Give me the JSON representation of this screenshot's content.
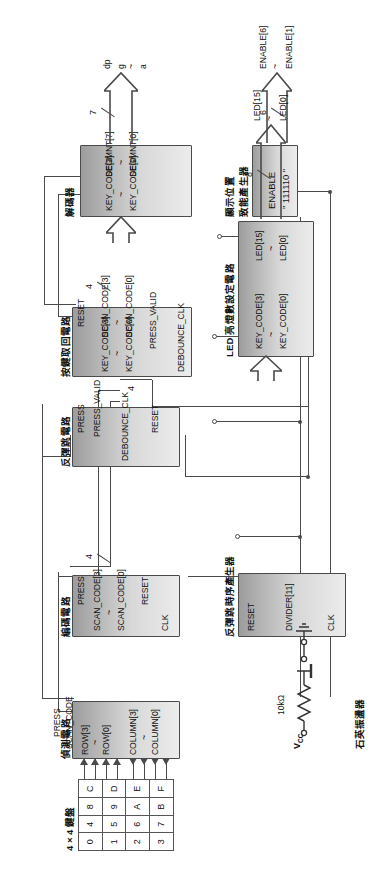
{
  "diagram": {
    "blocks": {
      "decoder": {
        "label": "解碼器",
        "in_top": "KEY_CODE[3]",
        "in_bot": "KEY_CODE[0]",
        "out_top": "SEGMNT[7]",
        "out_bot": "SEGMNT[0]",
        "bus_width": "7",
        "out_sig_top": "dp",
        "out_sig_mid": "g",
        "out_sig_bot": "a"
      },
      "enable_gen": {
        "label_line1": "顯示位置",
        "label_line2": "致能產生器",
        "body_line1": "ENABLE",
        "body_line2": "\" 111110 \"",
        "bus_width": "6",
        "out_top": "ENABLE[6]",
        "out_bot": "ENABLE[1]"
      },
      "key_fetch": {
        "label": "按鍵取回電路",
        "in_clk": "DEBOUNCE_CLK",
        "in_press_valid": "PRESS_VALID",
        "in_scan_top": "SCAN_CODE[3]",
        "in_scan_bot": "SCAN_CODE[0]",
        "in_reset": "RESET",
        "out_top": "KEY_CODE[3]",
        "out_bot": "KEY_CODE[0]",
        "bus_width_out": "4",
        "bus_width_in": "4"
      },
      "debounce": {
        "label": "反彈跳電路",
        "in_clk": "DEBOUNCE_CLK",
        "in_press": "PRESS",
        "in_reset": "RESET",
        "out": "PRESS_VALID"
      },
      "encoder": {
        "label": "編碼電路",
        "in_clk": "CLK",
        "in_press": "PRESS",
        "in_reset": "RESET",
        "out_top": "SCAN_CODE[3]",
        "out_bot": "SCAN_CODE[0]",
        "bus_width": "4"
      },
      "detect": {
        "label": "偵測電路",
        "io_row_top": "ROW[3]",
        "io_row_bot": "ROW[0]",
        "io_col_top": "COLUMN[3]",
        "io_col_bot": "COLUMN[0]",
        "out_press": "PRESS",
        "out_scan": "SCAN_CODE"
      },
      "timing_gen": {
        "label": "反彈跳時序產生器",
        "in_reset": "RESET",
        "in_clk": "CLK",
        "out": "DIVIDER[11]"
      },
      "led_set": {
        "label": "LED 亮燈數設定電路",
        "in_top": "KEY_CODE[3]",
        "in_bot": "KEY_CODE[0]",
        "out_top": "LED[15]",
        "out_bot": "LED[0]",
        "bus_width": "8",
        "ext_top": "LED[15]",
        "ext_bot": "LED[0]"
      }
    },
    "keypad": {
      "label": "4 × 4 鍵盤",
      "rows": [
        [
          "0",
          "4",
          "8",
          "C"
        ],
        [
          "1",
          "5",
          "9",
          "D"
        ],
        [
          "2",
          "6",
          "A",
          "E"
        ],
        [
          "3",
          "7",
          "B",
          "F"
        ]
      ]
    },
    "reset_circuit": {
      "vcc": "V",
      "vcc_sub": "CC",
      "resistor": "10kΩ"
    },
    "oscillator": {
      "label": "石英振盪器"
    },
    "colors": {
      "block_fill_light": "#ececec",
      "block_fill_dark": "#9c9c9c",
      "wire": "#4a4a4a",
      "text": "#111111"
    }
  }
}
